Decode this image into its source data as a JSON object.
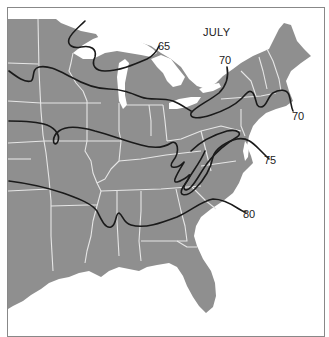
{
  "map": {
    "title": "JULY",
    "subject": "Isotherms over the eastern United States",
    "colors": {
      "land": "#8f8f8f",
      "water": "#ffffff",
      "state_borders": "#e6e6e6",
      "isotherm_lines": "#1a1a1a",
      "frame": "#888888"
    },
    "isotherms": [
      {
        "value": 65,
        "label": "65"
      },
      {
        "value": 70,
        "label": "70",
        "label_positions": 2
      },
      {
        "value": 75,
        "label": "75"
      },
      {
        "value": 80,
        "label": "80"
      }
    ],
    "labels": {
      "iso65": "65",
      "iso70_north": "70",
      "iso70_east": "70",
      "iso75": "75",
      "iso80": "80"
    }
  }
}
